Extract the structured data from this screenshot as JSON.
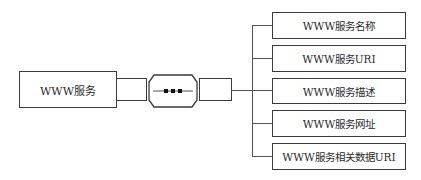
{
  "diagram": {
    "source_node": {
      "label": "WWW服务"
    },
    "connector": {
      "icon": "ellipsis-octagon"
    },
    "attributes": [
      {
        "label": "WWW服务名称"
      },
      {
        "label": "WWW服务URI"
      },
      {
        "label": "WWW服务描述"
      },
      {
        "label": "WWW服务网址"
      },
      {
        "label": "WWW服务相关数据URI"
      }
    ],
    "colors": {
      "stroke": "#3a3a3a",
      "fill": "#ffffff",
      "line": "#555555"
    }
  }
}
